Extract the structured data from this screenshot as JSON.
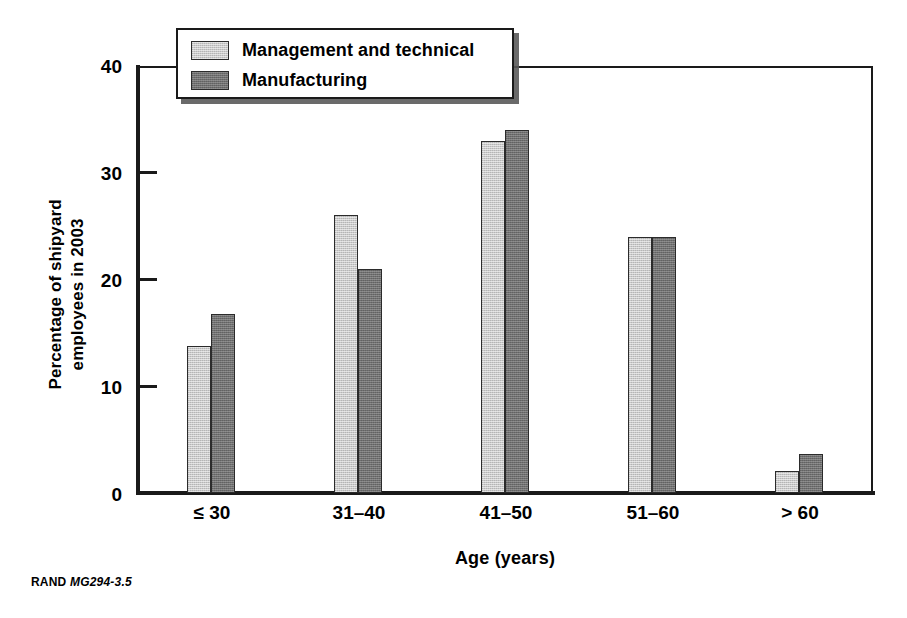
{
  "chart_data": {
    "type": "bar",
    "title": "",
    "xlabel": "Age (years)",
    "ylabel": "Percentage of shipyard employees in 2003",
    "ylabel_lines": [
      "Percentage of shipyard",
      "employees in 2003"
    ],
    "categories": [
      "≤ 30",
      "31–40",
      "41–50",
      "51–60",
      "> 60"
    ],
    "series": [
      {
        "name": "Management and technical",
        "color": "#c9c9c9",
        "values": [
          13.8,
          26.0,
          33.0,
          24.0,
          2.1
        ]
      },
      {
        "name": "Manufacturing",
        "color": "#6f6f6f",
        "values": [
          16.8,
          21.0,
          34.0,
          24.0,
          3.7
        ]
      }
    ],
    "ylim": [
      0,
      40
    ],
    "yticks": [
      0,
      10,
      20,
      30,
      40
    ],
    "ytick_labels": [
      "0",
      "10",
      "20",
      "30",
      "40"
    ],
    "grid": false,
    "legend_position": "top-left-inside"
  },
  "legend": {
    "entries": [
      {
        "label": "Management and technical"
      },
      {
        "label": "Manufacturing"
      }
    ]
  },
  "footer": {
    "org": "RAND",
    "figure_id": "MG294-3.5"
  }
}
